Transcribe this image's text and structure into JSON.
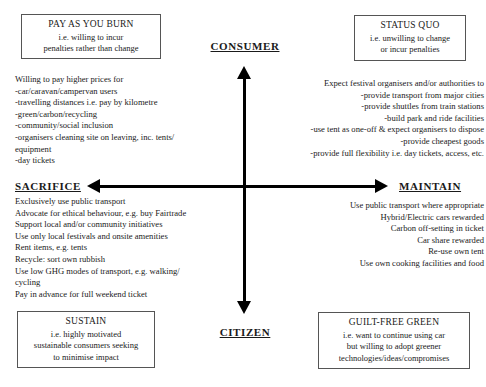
{
  "diagram": {
    "axes": {
      "vertical_top_label": "CONSUMER",
      "vertical_bottom_label": "CITIZEN",
      "horizontal_left_label": "SACRIFICE",
      "horizontal_right_label": "MAINTAIN"
    },
    "corner_boxes": {
      "top_left": {
        "title": "PAY AS YOU BURN",
        "line1": "i.e. willing to incur",
        "line2": "penalties rather than change"
      },
      "top_right": {
        "title": "STATUS QUO",
        "line1": "i.e. unwilling to change",
        "line2": "or incur penalties"
      },
      "bottom_left": {
        "title": "SUSTAIN",
        "line1": "i.e. highly motivated",
        "line2": "sustainable consumers seeking",
        "line3": "to minimise impact"
      },
      "bottom_right": {
        "title": "GUILT-FREE GREEN",
        "line1": "i.e. want to continue using car",
        "line2": "but willing to adopt greener",
        "line3": "technologies/ideas/compromises"
      }
    },
    "quadrant_text": {
      "top_left": "Willing to pay higher prices for\n-car/caravan/campervan users\n-travelling distances i.e. pay by kilometre\n-green/carbon/recycling\n-community/social inclusion\n-organisers cleaning site on leaving, inc. tents/\nequipment\n-day tickets",
      "top_right": "Expect festival organisers and/or authorities to\n-provide transport from major cities\n-provide shuttles from train stations\n-build park and ride facilities\n-use tent as one-off & expect organisers to dispose\n-provide cheapest goods\n-provide full flexibility i.e. day tickets, access, etc.",
      "bottom_left": "Exclusively use public transport\nAdvocate for ethical behaviour, e.g. buy Fairtrade\nSupport local and/or community initiatives\nUse only local festivals and onsite amenities\nRent items, e.g. tents\nRecycle: sort own rubbish\nUse low GHG modes of transport, e.g. walking/\ncycling\nPay in advance for full weekend ticket",
      "bottom_right": "Use public transport where appropriate\nHybrid/Electric cars rewarded\nCarbon off-setting in ticket\nCar share rewarded\nRe-use own tent\nUse own cooking facilities and food"
    }
  }
}
